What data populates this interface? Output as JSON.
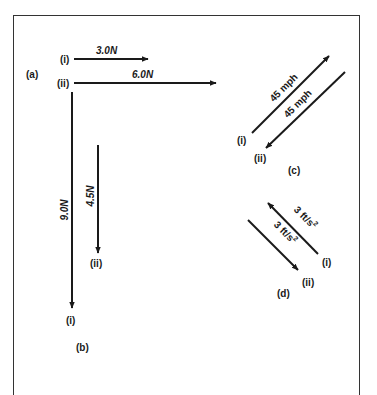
{
  "figure": {
    "panels": [
      {
        "id": "a",
        "label": "(a)",
        "vectors": [
          {
            "id": "i",
            "label": "(i)",
            "magnitude_label": "3.0N",
            "magnitude": 3.0,
            "unit": "N",
            "direction": "right"
          },
          {
            "id": "ii",
            "label": "(ii)",
            "magnitude_label": "6.0N",
            "magnitude": 6.0,
            "unit": "N",
            "direction": "right"
          }
        ]
      },
      {
        "id": "b",
        "label": "(b)",
        "vectors": [
          {
            "id": "i",
            "label": "(i)",
            "magnitude_label": "9.0N",
            "magnitude": 9.0,
            "unit": "N",
            "direction": "down"
          },
          {
            "id": "ii",
            "label": "(ii)",
            "magnitude_label": "4.5N",
            "magnitude": 4.5,
            "unit": "N",
            "direction": "down"
          }
        ]
      },
      {
        "id": "c",
        "label": "(c)",
        "vectors": [
          {
            "id": "i",
            "label": "(i)",
            "magnitude_label": "45 mph",
            "magnitude": 45,
            "unit": "mph",
            "direction": "up-right"
          },
          {
            "id": "ii",
            "label": "(ii)",
            "magnitude_label": "45 mph",
            "magnitude": 45,
            "unit": "mph",
            "direction": "down-left"
          }
        ]
      },
      {
        "id": "d",
        "label": "(d)",
        "vectors": [
          {
            "id": "i",
            "label": "(i)",
            "magnitude_label": "3 ft/s",
            "superscript": "2",
            "magnitude": 3,
            "unit": "ft/s²",
            "direction": "up-left"
          },
          {
            "id": "ii",
            "label": "(ii)",
            "magnitude_label": "3 ft/s",
            "superscript": "2",
            "magnitude": 3,
            "unit": "ft/s²",
            "direction": "down-right"
          }
        ]
      }
    ]
  },
  "colors": {
    "stroke": "#1a1a1a",
    "frame": "#333333",
    "background": "#ffffff"
  }
}
